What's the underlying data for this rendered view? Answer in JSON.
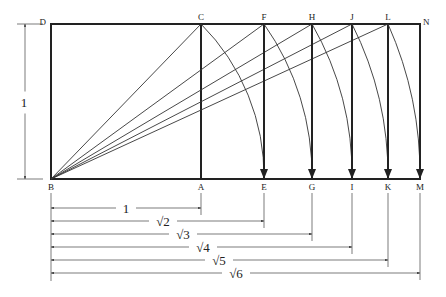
{
  "diagram": {
    "unit_label": "1",
    "points": {
      "D": {
        "label": "D",
        "x": 51,
        "y": 24
      },
      "C": {
        "label": "C",
        "x": 201,
        "y": 24
      },
      "F": {
        "label": "F",
        "x": 264,
        "y": 24
      },
      "H": {
        "label": "H",
        "x": 312,
        "y": 24
      },
      "J": {
        "label": "J",
        "x": 352,
        "y": 24
      },
      "L": {
        "label": "L",
        "x": 388,
        "y": 24
      },
      "N": {
        "label": "N",
        "x": 420,
        "y": 24
      },
      "B": {
        "label": "B",
        "x": 51,
        "y": 179
      },
      "A": {
        "label": "A",
        "x": 201,
        "y": 179
      },
      "E": {
        "label": "E",
        "x": 264,
        "y": 179
      },
      "G": {
        "label": "G",
        "x": 312,
        "y": 179
      },
      "I": {
        "label": "I",
        "x": 352,
        "y": 179
      },
      "K": {
        "label": "K",
        "x": 388,
        "y": 179
      },
      "M": {
        "label": "M",
        "x": 420,
        "y": 179
      }
    },
    "diagonals": [
      "C",
      "F",
      "H",
      "J",
      "L"
    ],
    "arcs": [
      {
        "from": "C",
        "to": "E"
      },
      {
        "from": "F",
        "to": "G"
      },
      {
        "from": "H",
        "to": "I"
      },
      {
        "from": "J",
        "to": "K"
      },
      {
        "from": "L",
        "to": "M"
      }
    ],
    "dimensions": [
      {
        "label": "1",
        "end": "A",
        "y": 208,
        "label_x": 126
      },
      {
        "label": "√2",
        "end": "E",
        "y": 221,
        "label_x": 163
      },
      {
        "label": "√3",
        "end": "G",
        "y": 234,
        "label_x": 183
      },
      {
        "label": "√4",
        "end": "I",
        "y": 247,
        "label_x": 203
      },
      {
        "label": "√5",
        "end": "K",
        "y": 260,
        "label_x": 219
      },
      {
        "label": "√6",
        "end": "M",
        "y": 273,
        "label_x": 236
      }
    ],
    "vertical_dimension": {
      "label": "1",
      "x": 25,
      "y_top": 24,
      "y_bottom": 179
    }
  }
}
